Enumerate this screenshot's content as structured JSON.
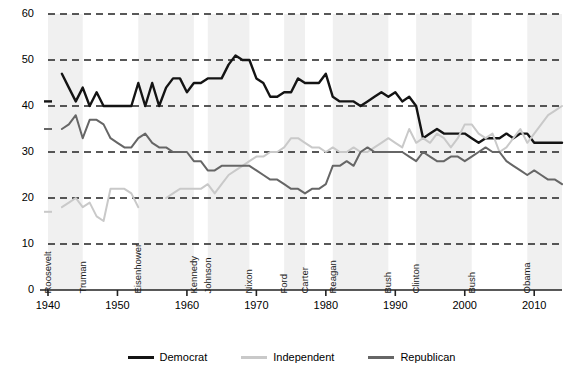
{
  "chart_data": {
    "type": "line",
    "title": "",
    "subtitle": "",
    "xlabel": "",
    "ylabel": "",
    "xlim": [
      1940,
      2014
    ],
    "ylim": [
      0,
      60
    ],
    "grid": true,
    "grid_style": "dashed-horizontal",
    "legend_position": "bottom",
    "y_ticks": [
      0,
      10,
      20,
      30,
      40,
      50,
      60
    ],
    "x_ticks": [
      1940,
      1950,
      1960,
      1970,
      1980,
      1990,
      2000,
      2010
    ],
    "x": [
      1940,
      1941,
      1942,
      1943,
      1944,
      1945,
      1946,
      1947,
      1948,
      1949,
      1950,
      1951,
      1952,
      1953,
      1954,
      1955,
      1956,
      1957,
      1958,
      1959,
      1960,
      1961,
      1962,
      1963,
      1964,
      1965,
      1966,
      1967,
      1968,
      1969,
      1970,
      1971,
      1972,
      1973,
      1974,
      1975,
      1976,
      1977,
      1978,
      1979,
      1980,
      1981,
      1982,
      1983,
      1984,
      1985,
      1986,
      1987,
      1988,
      1989,
      1990,
      1991,
      1992,
      1993,
      1994,
      1995,
      1996,
      1997,
      1998,
      1999,
      2000,
      2001,
      2002,
      2003,
      2004,
      2005,
      2006,
      2007,
      2008,
      2009,
      2010,
      2011,
      2012,
      2013,
      2014
    ],
    "series": [
      {
        "name": "Democrat",
        "color": "#141414",
        "values": [
          41,
          null,
          47,
          44,
          41,
          44,
          40,
          43,
          40,
          40,
          40,
          40,
          40,
          45,
          40,
          45,
          40,
          44,
          46,
          46,
          43,
          45,
          45,
          46,
          46,
          46,
          49,
          51,
          50,
          50,
          46,
          45,
          42,
          42,
          43,
          43,
          46,
          45,
          45,
          45,
          47,
          42,
          41,
          41,
          41,
          40,
          41,
          42,
          43,
          42,
          43,
          41,
          42,
          40,
          33,
          34,
          35,
          34,
          34,
          34,
          34,
          33,
          32,
          33,
          33,
          33,
          34,
          33,
          34,
          34,
          32,
          32,
          32,
          32,
          32
        ]
      },
      {
        "name": "Independent",
        "color": "#c9c9c9",
        "values": [
          17,
          null,
          18,
          19,
          20,
          18,
          19,
          16,
          15,
          22,
          22,
          22,
          21,
          18,
          null,
          null,
          null,
          20,
          21,
          22,
          22,
          22,
          22,
          23,
          21,
          23,
          25,
          26,
          27,
          28,
          29,
          29,
          30,
          30,
          31,
          33,
          33,
          32,
          31,
          31,
          30,
          31,
          30,
          30,
          31,
          30,
          30,
          31,
          32,
          33,
          32,
          31,
          35,
          32,
          33,
          32,
          34,
          33,
          31,
          33,
          36,
          36,
          34,
          33,
          34,
          30,
          31,
          33,
          35,
          32,
          34,
          36,
          38,
          39,
          40
        ]
      },
      {
        "name": "Republican",
        "color": "#666666",
        "values": [
          35,
          null,
          35,
          36,
          38,
          33,
          37,
          37,
          36,
          33,
          32,
          31,
          31,
          33,
          34,
          32,
          31,
          31,
          30,
          30,
          30,
          28,
          28,
          26,
          26,
          27,
          27,
          27,
          27,
          27,
          26,
          25,
          24,
          24,
          23,
          22,
          22,
          21,
          22,
          22,
          23,
          27,
          27,
          28,
          27,
          30,
          31,
          30,
          30,
          30,
          30,
          30,
          29,
          28,
          30,
          29,
          28,
          28,
          29,
          29,
          28,
          29,
          30,
          31,
          30,
          30,
          28,
          27,
          26,
          25,
          26,
          25,
          24,
          24,
          23
        ]
      }
    ],
    "shaded_terms": [
      {
        "president": "Roosevelt",
        "start": 1940,
        "end": 1945
      },
      {
        "president": "Truman",
        "start": 1945,
        "end": 1953
      },
      {
        "president": "Eisenhower",
        "start": 1953,
        "end": 1961
      },
      {
        "president": "Kennedy",
        "start": 1961,
        "end": 1963
      },
      {
        "president": "Johnson",
        "start": 1963,
        "end": 1969
      },
      {
        "president": "Nixon",
        "start": 1969,
        "end": 1974
      },
      {
        "president": "Ford",
        "start": 1974,
        "end": 1977
      },
      {
        "president": "Carter",
        "start": 1977,
        "end": 1981
      },
      {
        "president": "Reagan",
        "start": 1981,
        "end": 1989
      },
      {
        "president": "Bush",
        "start": 1989,
        "end": 1993
      },
      {
        "president": "Clinton",
        "start": 1993,
        "end": 2001
      },
      {
        "president": "Bush",
        "start": 2001,
        "end": 2009
      },
      {
        "president": "Obama",
        "start": 2009,
        "end": 2014
      }
    ],
    "shade_colors": [
      "#f0f0f0",
      "#ffffff"
    ]
  },
  "axis": {
    "y_tick_labels": [
      "0",
      "10",
      "20",
      "30",
      "40",
      "50",
      "60"
    ],
    "x_tick_labels": [
      "1940",
      "1950",
      "1960",
      "1970",
      "1980",
      "1990",
      "2000",
      "2010"
    ]
  },
  "president_labels": [
    "Roosevelt",
    "Truman",
    "Eisenhower",
    "Kennedy",
    "Johnson",
    "Nixon",
    "Ford",
    "Carter",
    "Reagan",
    "Bush",
    "Clinton",
    "Bush",
    "Obama"
  ],
  "legend": {
    "items": [
      {
        "label": "Democrat",
        "color": "#141414"
      },
      {
        "label": "Independent",
        "color": "#c9c9c9"
      },
      {
        "label": "Republican",
        "color": "#666666"
      }
    ]
  },
  "colors": {
    "democrat": "#141414",
    "independent": "#c9c9c9",
    "republican": "#666666",
    "grid": "#222222",
    "axis": "#222222",
    "band": "#f0f0f0",
    "background": "#ffffff"
  }
}
